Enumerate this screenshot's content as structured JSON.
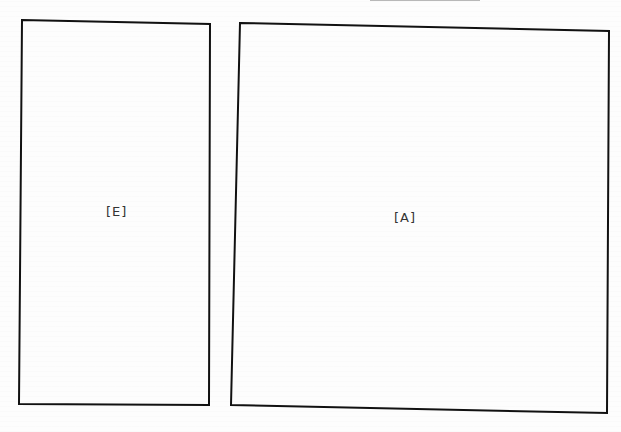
{
  "diagram": {
    "boxes": [
      {
        "id": "E",
        "label": "[E]"
      },
      {
        "id": "A",
        "label": "[A]"
      }
    ],
    "colors": {
      "stroke": "#111111",
      "text": "#333333",
      "background": "#fdfdfd"
    }
  }
}
